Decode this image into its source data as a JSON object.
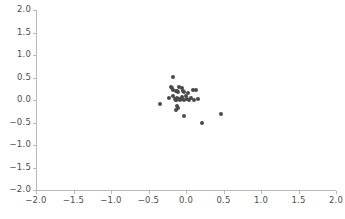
{
  "chart_data": {
    "type": "scatter",
    "title": "",
    "subtitle": "",
    "xlabel": "",
    "ylabel": "",
    "xlim": [
      -2.0,
      2.0
    ],
    "ylim": [
      -2.0,
      2.0
    ],
    "grid": false,
    "legend": null,
    "marker": {
      "shape": "circle",
      "color": "#4a4a4a",
      "size_px": 4
    },
    "axis_color": "#b9b9b9",
    "tick_label_color": "#4d4d4d",
    "background_color": "#ffffff",
    "xticks": [
      -2.0,
      -1.5,
      -1.0,
      -0.5,
      0.0,
      0.5,
      1.0,
      1.5,
      2.0
    ],
    "xtick_labels": [
      "−2.0",
      "−1.5",
      "−1.0",
      "−0.5",
      "0.0",
      "0.5",
      "1.0",
      "1.5",
      "2.0"
    ],
    "yticks": [
      -2.0,
      -1.5,
      -1.0,
      -0.5,
      0.0,
      0.5,
      1.0,
      1.5,
      2.0
    ],
    "ytick_labels": [
      "−2.0",
      "−1.5",
      "−1.0",
      "−0.5",
      "0.0",
      "0.5",
      "1.0",
      "1.5",
      "2.0"
    ],
    "points": [
      {
        "x": -0.17,
        "y": 0.51
      },
      {
        "x": -0.2,
        "y": 0.3
      },
      {
        "x": -0.19,
        "y": 0.26
      },
      {
        "x": -0.18,
        "y": 0.23
      },
      {
        "x": -0.1,
        "y": 0.29
      },
      {
        "x": -0.06,
        "y": 0.26
      },
      {
        "x": -0.13,
        "y": 0.21
      },
      {
        "x": -0.12,
        "y": 0.19
      },
      {
        "x": -0.11,
        "y": 0.17
      },
      {
        "x": -0.04,
        "y": 0.19
      },
      {
        "x": -0.03,
        "y": 0.17
      },
      {
        "x": 0.02,
        "y": 0.16
      },
      {
        "x": 0.09,
        "y": 0.22
      },
      {
        "x": 0.13,
        "y": 0.22
      },
      {
        "x": -0.23,
        "y": 0.04
      },
      {
        "x": -0.18,
        "y": 0.08
      },
      {
        "x": -0.15,
        "y": 0.03
      },
      {
        "x": -0.14,
        "y": 0.01
      },
      {
        "x": -0.13,
        "y": -0.01
      },
      {
        "x": -0.12,
        "y": 0.05
      },
      {
        "x": -0.09,
        "y": 0.02
      },
      {
        "x": -0.08,
        "y": 0.0
      },
      {
        "x": -0.06,
        "y": 0.07
      },
      {
        "x": -0.05,
        "y": 0.03
      },
      {
        "x": -0.03,
        "y": 0.0
      },
      {
        "x": 0.0,
        "y": 0.09
      },
      {
        "x": 0.01,
        "y": 0.02
      },
      {
        "x": 0.04,
        "y": -0.01
      },
      {
        "x": 0.07,
        "y": 0.05
      },
      {
        "x": 0.11,
        "y": 0.01
      },
      {
        "x": 0.16,
        "y": 0.02
      },
      {
        "x": -0.35,
        "y": -0.09
      },
      {
        "x": -0.12,
        "y": -0.13
      },
      {
        "x": -0.11,
        "y": -0.18
      },
      {
        "x": -0.14,
        "y": -0.22
      },
      {
        "x": -0.03,
        "y": -0.36
      },
      {
        "x": 0.21,
        "y": -0.52
      },
      {
        "x": 0.47,
        "y": -0.31
      }
    ]
  }
}
